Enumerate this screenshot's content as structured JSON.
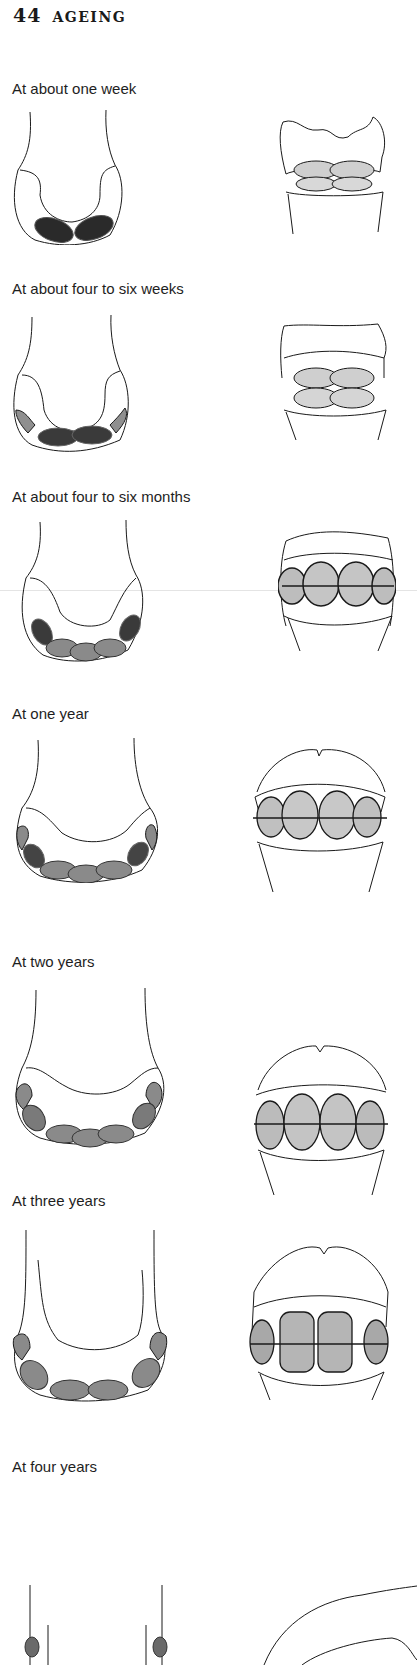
{
  "page": {
    "number": "44",
    "title": "AGEING"
  },
  "stages": [
    {
      "caption": "At about one week"
    },
    {
      "caption": "At about four to six weeks"
    },
    {
      "caption": "At about four to six months"
    },
    {
      "caption": "At one year"
    },
    {
      "caption": "At two years"
    },
    {
      "caption": "At three years"
    },
    {
      "caption": "At four years"
    }
  ],
  "colors": {
    "ink": "#1a1a1a",
    "tooth_fill": "#9a9a9a",
    "tooth_dark": "#3a3a3a",
    "tooth_light": "#d2d2d2"
  }
}
